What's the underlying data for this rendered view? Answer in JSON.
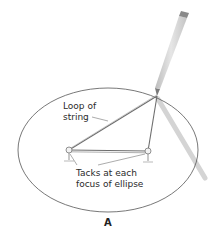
{
  "figure": {
    "panel_label": "A",
    "labels": {
      "loop_line1": "Loop of",
      "loop_line2": "string",
      "tacks_line1": "Tacks at each",
      "tacks_line2": "focus of ellipse"
    },
    "elements": {
      "ellipse": {
        "cx": 108,
        "cy": 150,
        "rx": 90,
        "ry": 62,
        "stroke": "#555555"
      },
      "tack_left": {
        "x": 69,
        "y": 150
      },
      "tack_right": {
        "x": 148,
        "y": 151
      },
      "pencil_tip": {
        "x": 157,
        "y": 96
      },
      "pencil_end": {
        "x": 183,
        "y": 16
      },
      "string_color": "#6e6e6e",
      "pencil_color": "#cfcfcf",
      "eraser_color": "#8a8a8a",
      "shadow_color": "#d6d6d6"
    }
  }
}
